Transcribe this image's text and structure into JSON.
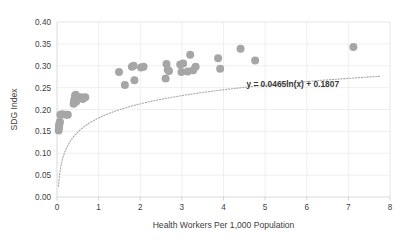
{
  "chart_data": {
    "type": "scatter",
    "title": "",
    "xlabel": "Health Workers Per 1,000 Population",
    "ylabel": "SDG Index",
    "xlim": [
      0,
      8
    ],
    "ylim": [
      0,
      0.4
    ],
    "xticks": [
      "0",
      "1",
      "2",
      "3",
      "4",
      "5",
      "6",
      "7",
      "8"
    ],
    "xtick_values": [
      0,
      1,
      2,
      3,
      4,
      5,
      6,
      7,
      8
    ],
    "yticks": [
      "0.00",
      "0.05",
      "0.10",
      "0.15",
      "0.20",
      "0.25",
      "0.30",
      "0.35",
      "0.40"
    ],
    "ytick_values": [
      0.0,
      0.05,
      0.1,
      0.15,
      0.2,
      0.25,
      0.3,
      0.35,
      0.4
    ],
    "grid": true,
    "grid_axes": "both",
    "legend": "none",
    "marker_color": "#a6a6a6",
    "marker_size": 4.0,
    "trendline": {
      "type": "logarithmic",
      "equation": "y = 0.0465ln(x) + 0.1807",
      "slope": 0.0465,
      "intercept": 0.1807,
      "style": "dotted",
      "color": "#a6a6a6"
    },
    "annotation": {
      "text": "y = 0.0465ln(x) + 0.1807",
      "x": 4.55,
      "y": 0.252
    },
    "points": [
      {
        "x": 0.04,
        "y": 0.152
      },
      {
        "x": 0.05,
        "y": 0.159
      },
      {
        "x": 0.05,
        "y": 0.164
      },
      {
        "x": 0.06,
        "y": 0.168
      },
      {
        "x": 0.07,
        "y": 0.172
      },
      {
        "x": 0.08,
        "y": 0.188
      },
      {
        "x": 0.13,
        "y": 0.189
      },
      {
        "x": 0.22,
        "y": 0.188
      },
      {
        "x": 0.26,
        "y": 0.188
      },
      {
        "x": 0.4,
        "y": 0.213
      },
      {
        "x": 0.41,
        "y": 0.221
      },
      {
        "x": 0.43,
        "y": 0.231
      },
      {
        "x": 0.44,
        "y": 0.226
      },
      {
        "x": 0.45,
        "y": 0.234
      },
      {
        "x": 0.46,
        "y": 0.218
      },
      {
        "x": 0.58,
        "y": 0.228
      },
      {
        "x": 0.62,
        "y": 0.224
      },
      {
        "x": 0.68,
        "y": 0.228
      },
      {
        "x": 1.49,
        "y": 0.286
      },
      {
        "x": 1.63,
        "y": 0.256
      },
      {
        "x": 1.8,
        "y": 0.298
      },
      {
        "x": 1.84,
        "y": 0.3
      },
      {
        "x": 1.86,
        "y": 0.267
      },
      {
        "x": 2.02,
        "y": 0.296
      },
      {
        "x": 2.08,
        "y": 0.298
      },
      {
        "x": 2.61,
        "y": 0.271
      },
      {
        "x": 2.63,
        "y": 0.304
      },
      {
        "x": 2.66,
        "y": 0.291
      },
      {
        "x": 2.69,
        "y": 0.288
      },
      {
        "x": 2.96,
        "y": 0.303
      },
      {
        "x": 2.99,
        "y": 0.286
      },
      {
        "x": 3.03,
        "y": 0.305
      },
      {
        "x": 3.14,
        "y": 0.287
      },
      {
        "x": 3.2,
        "y": 0.325
      },
      {
        "x": 3.27,
        "y": 0.29
      },
      {
        "x": 3.33,
        "y": 0.298
      },
      {
        "x": 3.87,
        "y": 0.317
      },
      {
        "x": 3.92,
        "y": 0.293
      },
      {
        "x": 4.41,
        "y": 0.339
      },
      {
        "x": 4.76,
        "y": 0.312
      },
      {
        "x": 7.12,
        "y": 0.343
      }
    ]
  }
}
